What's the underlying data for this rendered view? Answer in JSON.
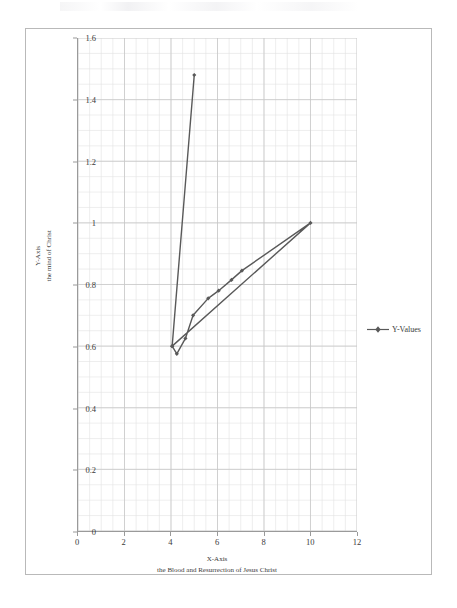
{
  "chart_data": {
    "type": "line",
    "title": "",
    "xlabel": "X-Axis",
    "xlabel_sub": "the Blood and Resurrection of Jesus Christ",
    "ylabel": "Y-Axis",
    "ylabel_sub": "the mind of Christ",
    "xlim": [
      0,
      12
    ],
    "ylim": [
      0,
      1.6
    ],
    "x_major_step": 2,
    "x_minor_step": 0.5,
    "y_major_step": 0.2,
    "y_minor_step": 0.05,
    "x_ticks": [
      "0",
      "2",
      "4",
      "6",
      "8",
      "10",
      "12"
    ],
    "x_tick_values": [
      0,
      2,
      4,
      6,
      8,
      10,
      12
    ],
    "y_ticks": [
      "0",
      "0.2",
      "0.4",
      "0.6",
      "0.8",
      "1",
      "1.2",
      "1.4",
      "1.6"
    ],
    "y_tick_values": [
      0,
      0.2,
      0.4,
      0.6,
      0.8,
      1.0,
      1.2,
      1.4,
      1.6
    ],
    "grid": true,
    "grid_minor": true,
    "legend_position": "right",
    "series": [
      {
        "name": "Y-Values",
        "color": "#595959",
        "marker": "diamond",
        "points": [
          [
            5.0,
            1.48
          ],
          [
            4.05,
            0.6
          ],
          [
            4.25,
            0.575
          ],
          [
            4.62,
            0.625
          ],
          [
            4.95,
            0.7
          ],
          [
            5.6,
            0.755
          ],
          [
            6.05,
            0.78
          ],
          [
            6.6,
            0.815
          ],
          [
            7.05,
            0.845
          ],
          [
            10.0,
            1.0
          ],
          [
            4.05,
            0.6
          ]
        ]
      }
    ],
    "colors": {
      "series": "#595959",
      "grid_major": "#c8c8c8",
      "grid_minor": "#e2e2e2",
      "axis": "#9a9a9a",
      "text": "#3a3a3a",
      "frame": "#b9b9b9",
      "background": "#ffffff"
    }
  },
  "legend": {
    "entries": [
      {
        "label": "Y-Values"
      }
    ]
  }
}
